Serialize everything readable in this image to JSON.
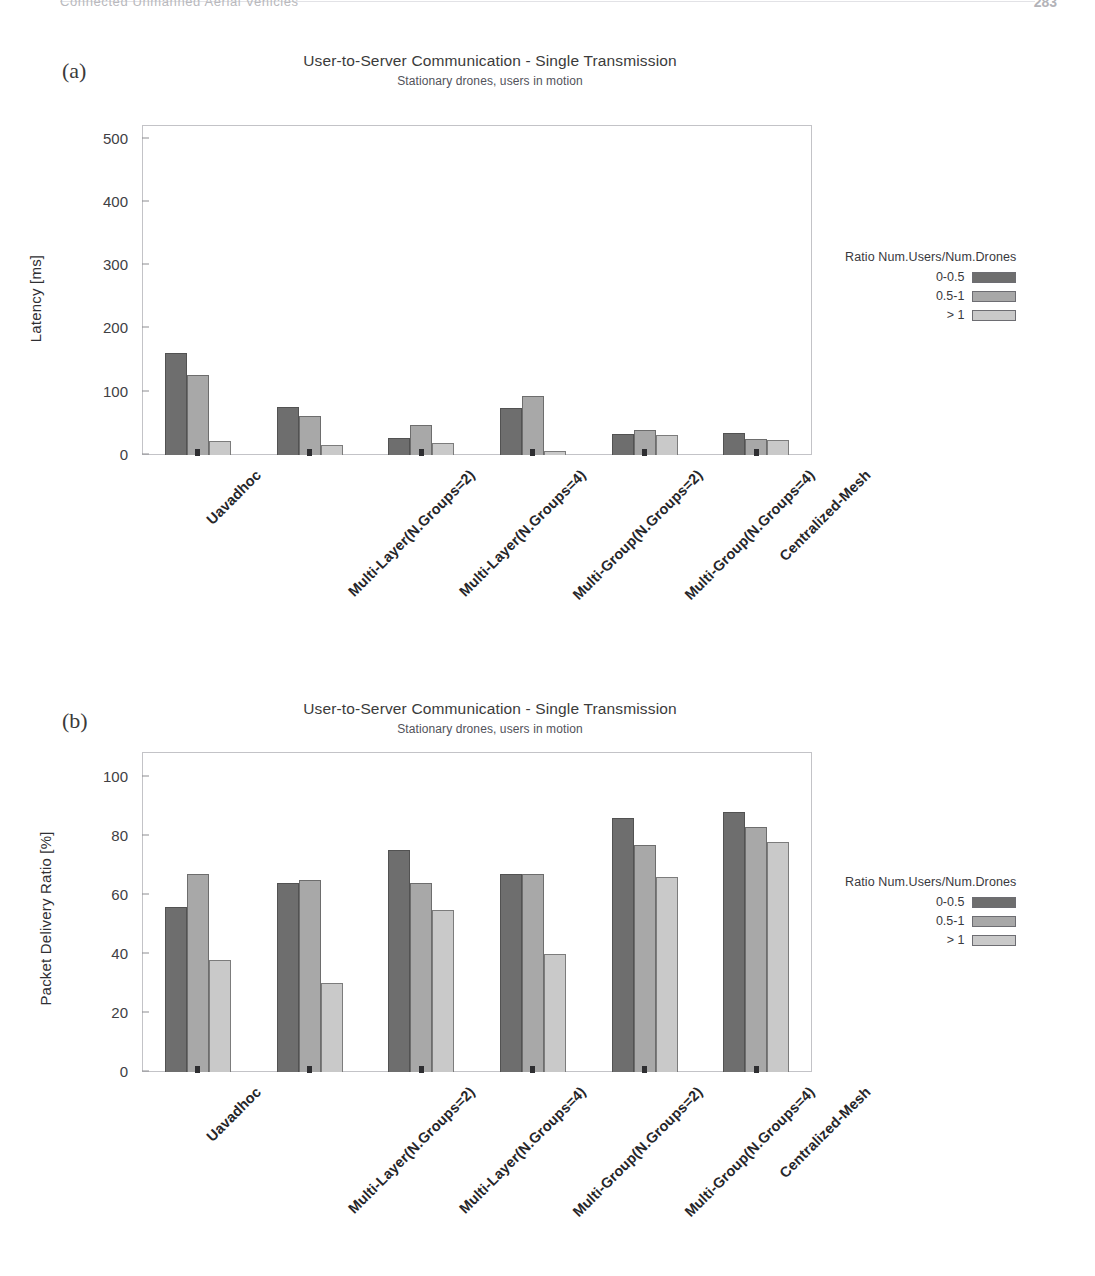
{
  "page": {
    "running_head": "Connected Unmanned Aerial Vehicles",
    "folio": "283"
  },
  "legend": {
    "title": "Ratio Num.Users/Num.Drones",
    "entries": [
      {
        "label": "0-0.5",
        "color": "#6e6e6e"
      },
      {
        "label": "0.5-1",
        "color": "#a8a8a8"
      },
      {
        "label": "> 1",
        "color": "#c9c9c9"
      }
    ]
  },
  "figures": [
    {
      "tag": "(a)",
      "chart_data": {
        "type": "bar",
        "title": "User-to-Server Communication - Single Transmission",
        "subtitle": "Stationary drones, users in motion",
        "xlabel": "",
        "ylabel": "Latency [ms]",
        "ylim": [
          0,
          520
        ],
        "yticks": [
          0,
          100,
          200,
          300,
          400,
          500
        ],
        "grid": false,
        "legend_position": "right",
        "legend_title": "Ratio Num.Users/Num.Drones",
        "categories": [
          "Uavadhoc",
          "Multi-Layer(N.Groups=2)",
          "Multi-Layer(N.Groups=4)",
          "Multi-Group(N.Groups=2)",
          "Multi-Group(N.Groups=4)",
          "Centralized-Mesh"
        ],
        "series": [
          {
            "name": "0-0.5",
            "color": "#6e6e6e",
            "values": [
              162,
              76,
              27,
              74,
              33,
              35
            ]
          },
          {
            "name": "0.5-1",
            "color": "#a8a8a8",
            "values": [
              127,
              62,
              48,
              93,
              39,
              25
            ]
          },
          {
            "name": "> 1",
            "color": "#c9c9c9",
            "values": [
              22,
              16,
              19,
              6,
              32,
              24
            ]
          }
        ]
      }
    },
    {
      "tag": "(b)",
      "chart_data": {
        "type": "bar",
        "title": "User-to-Server Communication - Single Transmission",
        "subtitle": "Stationary drones, users in motion",
        "xlabel": "",
        "ylabel": "Packet Delivery Ratio [%]",
        "ylim": [
          0,
          108
        ],
        "yticks": [
          0,
          20,
          40,
          60,
          80,
          100
        ],
        "grid": false,
        "legend_position": "right",
        "legend_title": "Ratio Num.Users/Num.Drones",
        "categories": [
          "Uavadhoc",
          "Multi-Layer(N.Groups=2)",
          "Multi-Layer(N.Groups=4)",
          "Multi-Group(N.Groups=2)",
          "Multi-Group(N.Groups=4)",
          "Centralized-Mesh"
        ],
        "series": [
          {
            "name": "0-0.5",
            "color": "#6e6e6e",
            "values": [
              56,
              64,
              75,
              67,
              86,
              88
            ]
          },
          {
            "name": "0.5-1",
            "color": "#a8a8a8",
            "values": [
              67,
              65,
              64,
              67,
              77,
              83
            ]
          },
          {
            "name": "> 1",
            "color": "#c9c9c9",
            "values": [
              38,
              30,
              55,
              40,
              66,
              78
            ]
          }
        ]
      }
    }
  ]
}
